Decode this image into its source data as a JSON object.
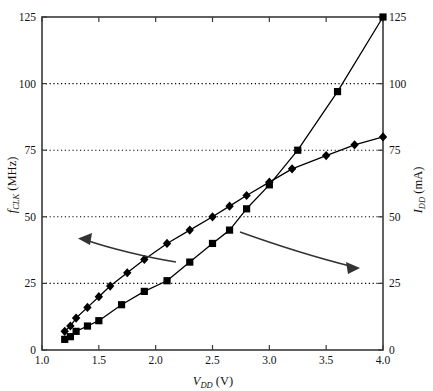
{
  "chart_data": {
    "type": "line",
    "title": "",
    "xlabel": "V_DD (V)",
    "xlabel_main": "V",
    "xlabel_sub": "DD",
    "xlabel_unit": " (V)",
    "ylabel_left_main": "f",
    "ylabel_left_sub": "CLK",
    "ylabel_left_unit": " (MHz)",
    "ylabel_right_main": "I",
    "ylabel_right_sub": "DD",
    "ylabel_right_unit": " (mA)",
    "xlim": [
      1.0,
      4.0
    ],
    "ylim": [
      0,
      125
    ],
    "ylim_right": [
      0,
      125
    ],
    "grid": "horizontal-dotted",
    "legend": "none",
    "xticks": [
      1.0,
      1.5,
      2.0,
      2.5,
      3.0,
      3.5,
      4.0
    ],
    "xticklabels": [
      "1.0",
      "1.5",
      "2.0",
      "2.5",
      "3.0",
      "3.5",
      "4.0"
    ],
    "yticks": [
      0,
      25,
      50,
      75,
      100,
      125
    ],
    "yticklabels": [
      "0",
      "25",
      "50",
      "75",
      "100",
      "125"
    ],
    "yticklabels_right": [
      "0",
      "25",
      "50",
      "75",
      "100",
      "125"
    ],
    "series": [
      {
        "name": "f_CLK (MHz)",
        "marker": "diamond",
        "axis": "left",
        "x": [
          1.2,
          1.25,
          1.3,
          1.4,
          1.5,
          1.6,
          1.75,
          1.9,
          2.1,
          2.3,
          2.5,
          2.65,
          2.8,
          3.0,
          3.2,
          3.5,
          3.75,
          4.0
        ],
        "y": [
          7,
          9,
          12,
          16,
          20,
          24,
          29,
          34,
          40,
          45,
          50,
          54,
          58,
          63,
          68,
          73,
          77,
          80
        ]
      },
      {
        "name": "I_DD (mA)",
        "marker": "square",
        "axis": "right",
        "x": [
          1.2,
          1.25,
          1.3,
          1.4,
          1.5,
          1.7,
          1.9,
          2.1,
          2.3,
          2.5,
          2.65,
          2.8,
          3.0,
          3.25,
          3.6,
          4.0
        ],
        "y": [
          4,
          5,
          7,
          9,
          11,
          17,
          22,
          26,
          33,
          40,
          45,
          53,
          62,
          75,
          97,
          125
        ]
      }
    ],
    "annotations": [
      {
        "name": "left-arrow",
        "points_to": "f_CLK (MHz) curve",
        "direction": "left"
      },
      {
        "name": "right-arrow",
        "points_to": "I_DD (mA) curve",
        "direction": "right"
      }
    ]
  }
}
